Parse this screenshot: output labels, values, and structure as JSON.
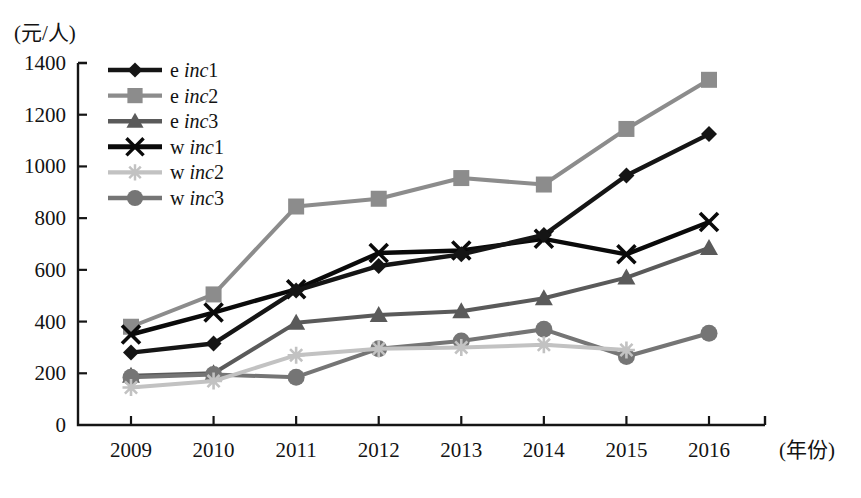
{
  "chart_data": {
    "type": "line",
    "title": "",
    "xlabel": "(年份)",
    "ylabel": "(元/人)",
    "x": [
      "2009",
      "2010",
      "2011",
      "2012",
      "2013",
      "2014",
      "2015",
      "2016"
    ],
    "categories": [
      "2009",
      "2010",
      "2011",
      "2012",
      "2013",
      "2014",
      "2015",
      "2016"
    ],
    "ylim": [
      0,
      1400
    ],
    "yticks": [
      "0",
      "200",
      "400",
      "600",
      "800",
      "1000",
      "1200",
      "1400"
    ],
    "ytick_values": [
      0,
      200,
      400,
      600,
      800,
      1000,
      1200,
      1400
    ],
    "grid": false,
    "legend_position": "top-left",
    "series": [
      {
        "name": "e inc1",
        "prefix": "e",
        "italic": "inc",
        "suffix": "1",
        "marker": "diamond",
        "color": "#151515",
        "values": [
          280,
          315,
          520,
          615,
          660,
          735,
          965,
          1125
        ]
      },
      {
        "name": "e inc2",
        "prefix": "e",
        "italic": "inc",
        "suffix": "2",
        "marker": "square",
        "color": "#8c8c8c",
        "values": [
          380,
          505,
          845,
          875,
          955,
          930,
          1145,
          1335
        ]
      },
      {
        "name": "e inc3",
        "prefix": "e",
        "italic": "inc",
        "suffix": "3",
        "marker": "triangle",
        "color": "#5a5a5a",
        "values": [
          190,
          200,
          395,
          425,
          440,
          490,
          570,
          685
        ]
      },
      {
        "name": "w inc1",
        "prefix": "w",
        "italic": "inc",
        "suffix": "1",
        "marker": "cross",
        "color": "#0a0a0a",
        "values": [
          350,
          435,
          525,
          665,
          675,
          720,
          660,
          785
        ]
      },
      {
        "name": "w inc2",
        "prefix": "w",
        "italic": "inc",
        "suffix": "2",
        "marker": "asterisk",
        "color": "#c2c2c2",
        "values": [
          145,
          170,
          270,
          295,
          300,
          310,
          290,
          null
        ]
      },
      {
        "name": "w inc3",
        "prefix": "w",
        "italic": "inc",
        "suffix": "3",
        "marker": "circle",
        "color": "#757575",
        "values": [
          185,
          195,
          185,
          295,
          325,
          370,
          265,
          355
        ]
      }
    ]
  },
  "axis": {
    "y_unit_label": "(元/人)",
    "x_unit_label": "(年份)"
  },
  "colors": {
    "axis": "#151515",
    "background": "#ffffff"
  }
}
